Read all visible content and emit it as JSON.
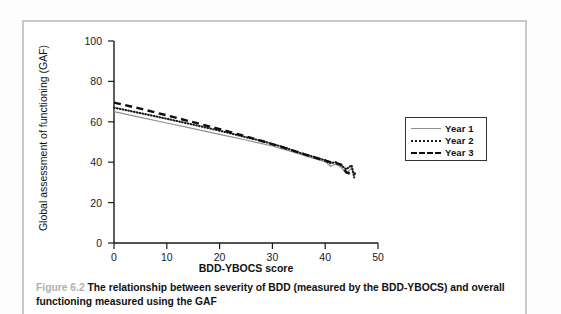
{
  "figure": {
    "caption_number": "Figure 6.2",
    "caption_text": "The relationship between severity of BDD (measured by the BDD-YBOCS) and overall functioning measured using the GAF"
  },
  "legend": {
    "position": "right",
    "items": [
      {
        "label": "Year 1",
        "style": "solid",
        "color": "#8f8f8f"
      },
      {
        "label": "Year 2",
        "style": "dotted",
        "color": "#1a1a1a"
      },
      {
        "label": "Year 3",
        "style": "dashed",
        "color": "#0d0d0d"
      }
    ]
  },
  "axes": {
    "x_ticks": [
      "0",
      "10",
      "20",
      "30",
      "40",
      "50"
    ],
    "y_ticks": [
      "0",
      "20",
      "40",
      "60",
      "80",
      "100"
    ],
    "xlabel": "BDD-YBOCS score",
    "ylabel": "Global assessment of functioning (GAF)"
  },
  "chart_data": {
    "type": "line",
    "title": "",
    "xlabel": "BDD-YBOCS score",
    "ylabel": "Global assessment of functioning (GAF)",
    "xlim": [
      0,
      50
    ],
    "ylim": [
      0,
      100
    ],
    "xticks": [
      0,
      10,
      20,
      30,
      40,
      50
    ],
    "yticks": [
      0,
      20,
      40,
      60,
      80,
      100
    ],
    "grid": false,
    "legend_position": "right-outside",
    "series": [
      {
        "name": "Year 1",
        "style": "solid",
        "color": "#8f8f8f",
        "x": [
          0,
          5,
          10,
          15,
          20,
          25,
          30,
          34,
          37,
          39,
          40,
          41,
          42,
          43,
          44,
          45,
          45.5
        ],
        "y": [
          65.0,
          62.2,
          59.4,
          56.6,
          53.8,
          51.0,
          48.0,
          45.0,
          42.5,
          41.0,
          40.3,
          38.0,
          39.0,
          37.5,
          34.5,
          37.0,
          33.5
        ]
      },
      {
        "name": "Year 2",
        "style": "dotted",
        "color": "#1a1a1a",
        "x": [
          0,
          5,
          10,
          15,
          20,
          24,
          28,
          32,
          36,
          38,
          40,
          41,
          42,
          43,
          44,
          45,
          45.5
        ],
        "y": [
          67.0,
          64.3,
          61.5,
          58.6,
          55.6,
          53.0,
          50.5,
          47.5,
          44.0,
          42.5,
          41.0,
          39.5,
          40.0,
          38.5,
          36.5,
          38.5,
          32.5
        ]
      },
      {
        "name": "Year 3",
        "style": "dashed",
        "color": "#0d0d0d",
        "x": [
          0,
          5,
          10,
          15,
          20,
          24,
          28,
          32,
          36,
          39,
          41,
          42,
          43,
          44,
          45,
          45.8
        ],
        "y": [
          69.5,
          66.5,
          63.2,
          59.8,
          56.4,
          53.5,
          50.5,
          47.3,
          44.0,
          41.5,
          40.0,
          39.5,
          38.8,
          35.0,
          34.0,
          34.5
        ]
      }
    ]
  },
  "plot_geometry": {
    "left_px": 114,
    "right_px": 378,
    "bottom_px": 243,
    "top_px": 41
  }
}
